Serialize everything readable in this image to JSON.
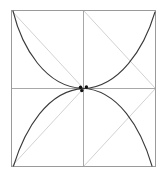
{
  "canvas": {
    "width": 167,
    "height": 177,
    "background_color": "#ffffff",
    "title": "Square with crossing arcs and diagonal construction lines"
  },
  "colors": {
    "frame_stroke": "#9a9a9a",
    "midline_stroke": "#a8a8a8",
    "diagonal_stroke": "#d2d2d2",
    "arc_stroke": "#3a3a3a",
    "dot_fill": "#111111",
    "background": "#ffffff"
  },
  "strokes": {
    "frame_width": 1,
    "midline_width": 1,
    "diagonal_width": 1,
    "arc_width": 1.1,
    "dot_radius": 1.7
  },
  "geometry": {
    "square": {
      "label": "outer-square",
      "left": 11.5,
      "top": 10.5,
      "right": 155.5,
      "bottom": 166.5,
      "width": 144,
      "height": 156
    },
    "center": {
      "label": "square-center",
      "x": 83.5,
      "y": 88.5
    }
  },
  "chart_data": {
    "type": "diagram",
    "title": "Square with crossing arcs and diagonal construction lines",
    "elements": [
      {
        "name": "outer-square",
        "kind": "rect",
        "stroke": "#9a9a9a",
        "x": 11.5,
        "y": 10.5,
        "w": 144,
        "h": 156
      },
      {
        "name": "horizontal-midline",
        "kind": "line",
        "stroke": "#a8a8a8",
        "x1": 11.5,
        "y1": 88.5,
        "x2": 155.5,
        "y2": 88.5
      },
      {
        "name": "vertical-midline",
        "kind": "line",
        "stroke": "#a8a8a8",
        "x1": 83.5,
        "y1": 10.5,
        "x2": 83.5,
        "y2": 166.5
      },
      {
        "name": "diagonal-top-left-quadrant",
        "kind": "line",
        "stroke": "#d2d2d2",
        "x1": 11.5,
        "y1": 10.5,
        "x2": 83.5,
        "y2": 88.5
      },
      {
        "name": "diagonal-top-right-quadrant",
        "kind": "line",
        "stroke": "#d2d2d2",
        "x1": 83.5,
        "y1": 10.5,
        "x2": 155.5,
        "y2": 88.5
      },
      {
        "name": "diagonal-bottom-left-quadrant",
        "kind": "line",
        "stroke": "#d2d2d2",
        "x1": 11.5,
        "y1": 166.5,
        "x2": 83.5,
        "y2": 88.5
      },
      {
        "name": "diagonal-bottom-right-quadrant",
        "kind": "line",
        "stroke": "#d2d2d2",
        "x1": 83.5,
        "y1": 166.5,
        "x2": 155.5,
        "y2": 88.5
      },
      {
        "name": "arc-descending",
        "kind": "path",
        "stroke": "#3a3a3a",
        "d": "M 13 11 Q 30 92 84 89 Q 130 86 152 166",
        "from": "top-left corner",
        "to": "bottom edge near right corner"
      },
      {
        "name": "arc-ascending",
        "kind": "path",
        "stroke": "#3a3a3a",
        "d": "M 13 166 Q 36 90 83 88 Q 131 86 155 12",
        "from": "bottom-left corner",
        "to": "top-right corner"
      },
      {
        "name": "intersection-dot-left",
        "kind": "dot",
        "fill": "#111111",
        "cx": 80.5,
        "cy": 87.2,
        "r": 1.7
      },
      {
        "name": "intersection-dot-right",
        "kind": "dot",
        "fill": "#111111",
        "cx": 86.4,
        "cy": 87.0,
        "r": 1.7
      },
      {
        "name": "intersection-dot-lower",
        "kind": "dot",
        "fill": "#111111",
        "cx": 81.8,
        "cy": 90.6,
        "r": 1.7
      }
    ]
  }
}
